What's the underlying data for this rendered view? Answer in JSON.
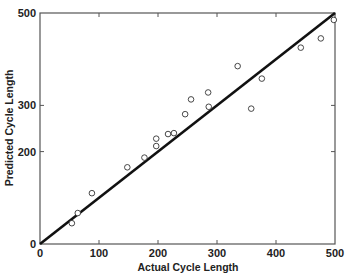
{
  "chart_data": {
    "type": "scatter",
    "title": "",
    "xlabel": "Actual Cycle Length",
    "ylabel": "Predicted Cycle Length",
    "xlim": [
      0,
      500
    ],
    "ylim": [
      0,
      500
    ],
    "x_ticks": [
      0,
      100,
      200,
      300,
      400,
      500
    ],
    "x_tick_labels": [
      "0",
      "100",
      "200",
      "300",
      "400",
      "500"
    ],
    "y_ticks": [
      0,
      200,
      300,
      500
    ],
    "y_tick_labels": [
      "0",
      "200",
      "300",
      "500"
    ],
    "grid": false,
    "legend": null,
    "reference_line": {
      "type": "identity",
      "from": [
        0,
        0
      ],
      "to": [
        500,
        500
      ],
      "style": "solid thick black"
    },
    "series": [
      {
        "name": "observations",
        "marker": "open-circle",
        "x": [
          54,
          64,
          88,
          148,
          177,
          197,
          197,
          217,
          227,
          246,
          256,
          285,
          286,
          335,
          358,
          376,
          442,
          476,
          498
        ],
        "y": [
          45,
          67,
          110,
          166,
          187,
          212,
          228,
          238,
          240,
          281,
          313,
          328,
          297,
          385,
          293,
          358,
          425,
          445,
          485
        ]
      }
    ]
  }
}
